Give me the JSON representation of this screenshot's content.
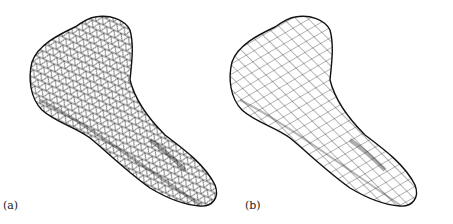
{
  "figure": {
    "panels": [
      {
        "id": "a",
        "label": "(a)",
        "mesh_type": "triangle-mesh"
      },
      {
        "id": "b",
        "label": "(b)",
        "mesh_type": "quad-mesh"
      }
    ],
    "colors": {
      "background": "#ffffff",
      "mesh_stroke": "#111111"
    }
  }
}
